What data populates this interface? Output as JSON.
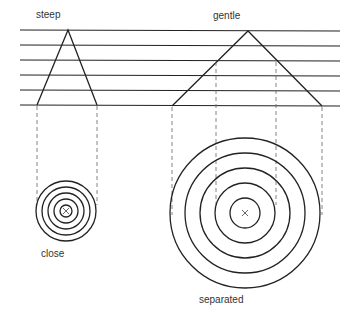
{
  "labels": {
    "steep": "steep",
    "gentle": "gentle",
    "close": "close",
    "separated": "separated"
  },
  "diagram": {
    "horizontal_levels": 6,
    "small_circles": 5,
    "large_circles": 5,
    "summit_marker": "x"
  }
}
